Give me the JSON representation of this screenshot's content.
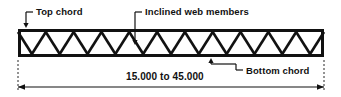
{
  "figure": {
    "type": "truss-elevation-diagram",
    "background_color": "#ffffff",
    "line_color": "#111111"
  },
  "labels": {
    "top_chord": "Top chord",
    "inclined_web_members": "Inclined web members",
    "bottom_chord": "Bottom chord"
  },
  "dimension": {
    "span_text": "15.000 to 45.000",
    "min": "15.000",
    "max": "45.000",
    "separator": "to"
  },
  "truss": {
    "style": "warren",
    "left": 18,
    "right": 324,
    "top": 29,
    "bottom": 57,
    "chord_thickness": 3,
    "web_thickness": 2.6,
    "panel_count": 11,
    "diagonal_count": 22,
    "end_posts": 2
  },
  "leaders": {
    "top_chord": {
      "text_anchor_x": 33,
      "elbow_x": 26,
      "elbow_y": 12,
      "arrow_x": 26,
      "arrow_y": 28,
      "arrow_direction": "down"
    },
    "inclined_web_members": {
      "text_anchor_x": 142,
      "elbow_x": 135,
      "elbow_y": 12,
      "arrow_x": 135,
      "arrow_y": 45,
      "arrow_direction": "down"
    },
    "bottom_chord": {
      "text_anchor_x": 243,
      "elbow_x": 236,
      "elbow_y": 70,
      "arrow_x": 211,
      "arrow_y": 58,
      "arrow_direction": "up"
    }
  },
  "dimension_line": {
    "y": 87,
    "left_x": 18,
    "right_x": 324,
    "extension_top": 60,
    "extension_bottom": 92,
    "arrow_style": "filled-triangle-both-ends"
  }
}
